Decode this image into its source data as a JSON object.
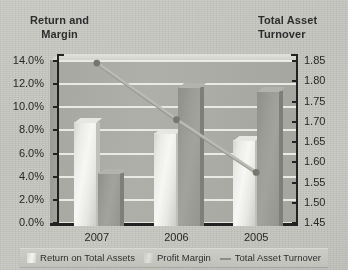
{
  "chart_data": {
    "type": "bar",
    "title": "",
    "categories": [
      "2007",
      "2006",
      "2005"
    ],
    "series": [
      {
        "name": "Return on Total Assets",
        "axis": "left",
        "type": "bar",
        "values": [
          4.6,
          12.0,
          11.7
        ]
      },
      {
        "name": "Profit Margin",
        "axis": "left",
        "type": "bar",
        "values": [
          9.0,
          8.0,
          7.4
        ]
      },
      {
        "name": "Total Asset Turnover",
        "axis": "right",
        "type": "line",
        "values": [
          1.845,
          1.705,
          1.575
        ]
      }
    ],
    "xlabel": "",
    "ylabel": "Return and Margin",
    "y2label": "Total Asset Turnover",
    "ylim": [
      0,
      14
    ],
    "y2lim": [
      1.45,
      1.85
    ],
    "ytick_labels": [
      "14.0%",
      "12.0%",
      "10.0%",
      "8.0%",
      "6.0%",
      "4.0%",
      "2.0%",
      "0.0%"
    ],
    "y2tick_labels": [
      "1.85",
      "1.80",
      "1.75",
      "1.70",
      "1.65",
      "1.60",
      "1.55",
      "1.50",
      "1.45"
    ],
    "grid": true,
    "legend_position": "bottom"
  },
  "axis_titles": {
    "left_line1": "Return and",
    "left_line2": "Margin",
    "right_line1": "Total Asset",
    "right_line2": "Turnover"
  },
  "legend": {
    "items": [
      {
        "label": "Return on Total Assets",
        "marker": "bar-swatch-light"
      },
      {
        "label": "Profit Margin",
        "marker": "bar-swatch-pale"
      },
      {
        "label": "Total Asset Turnover",
        "marker": "line-glyph"
      }
    ]
  },
  "colors": {
    "background": "#c8c8c3",
    "plot_back_wall": "#adada8",
    "gridline": "#f2f2ee",
    "axis": "#1f1f1f",
    "bar_light": "#f5f5f1",
    "bar_dark": "#9d9d98",
    "line": "#bdbdb8",
    "line_marker": "#77776f",
    "text": "#242424"
  }
}
